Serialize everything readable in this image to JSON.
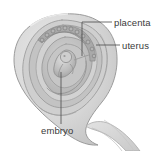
{
  "figure": {
    "type": "anatomical-illustration",
    "width": 161,
    "height": 151,
    "background_color": "#ffffff"
  },
  "labels": [
    {
      "id": "placenta",
      "text": "placenta",
      "position": {
        "x": 114,
        "y": 18
      },
      "leader": {
        "shape": "elbow",
        "text_end": {
          "x": 112,
          "y": 22
        },
        "corner": {
          "x": 82,
          "y": 22
        },
        "target": {
          "x": 82,
          "y": 56
        }
      }
    },
    {
      "id": "uterus",
      "text": "uterus",
      "position": {
        "x": 122,
        "y": 41
      },
      "leader": {
        "shape": "straight",
        "text_end": {
          "x": 120,
          "y": 45
        },
        "target": {
          "x": 96,
          "y": 45
        }
      }
    },
    {
      "id": "embryo",
      "text": "embryo",
      "position": {
        "x": 41,
        "y": 126
      },
      "leader": {
        "shape": "straight",
        "text_end": {
          "x": 61,
          "y": 124
        },
        "target": {
          "x": 61,
          "y": 72
        }
      }
    }
  ],
  "colors": {
    "outline": "#8a8a8a",
    "leader_line": "#4a4a4a",
    "label_text": "#3a3a3a",
    "uterus_outer_fill": "#dcdcdc",
    "uterus_outer_edge": "#c4c4c4",
    "wall_band_light": "#d0d0d0",
    "wall_band_mid": "#b6b6b6",
    "wall_band_dark": "#9d9d9d",
    "cavity_fill": "#c8c8c8",
    "placenta_fill": "#a9a9a9",
    "embryo_fill": "#c0c0c0",
    "embryo_shade": "#9a9a9a",
    "cervix_fill": "#d6d6d6"
  },
  "structures": [
    {
      "id": "uterus-body",
      "name": "uterus body (teardrop)"
    },
    {
      "id": "uterine-wall",
      "name": "concentric uterine wall layers"
    },
    {
      "id": "placenta-villi",
      "name": "placental villous border"
    },
    {
      "id": "embryo-body",
      "name": "curled embryo"
    },
    {
      "id": "cervix-tail",
      "name": "cervix / vaginal canal tail"
    }
  ]
}
